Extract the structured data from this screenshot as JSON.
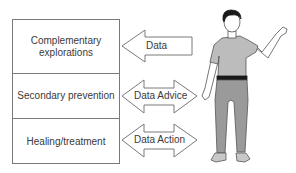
{
  "diagram": {
    "boxes": [
      {
        "line1": "Complementary",
        "line2": "explorations"
      },
      {
        "line1": "Secondary prevention"
      },
      {
        "line1": "Healing/treatment"
      }
    ],
    "arrows": [
      {
        "label": "Data",
        "direction": "left"
      },
      {
        "label": "Data Advice",
        "direction": "both"
      },
      {
        "label": "Data Action",
        "direction": "both"
      }
    ],
    "figure": {
      "description": "standing person waving",
      "icon": "person-icon"
    },
    "colors": {
      "stroke": "#7a7a7a",
      "text": "#3a3a3a",
      "shirt": "#bcbcbc",
      "pants": "#9a9a9a",
      "hair": "#1a1a1a"
    }
  }
}
